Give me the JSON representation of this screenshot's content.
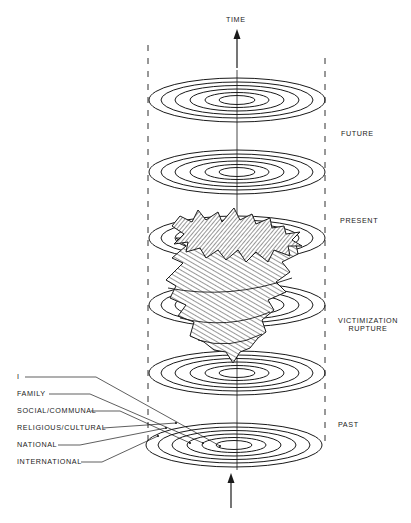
{
  "axis": {
    "label": "TIME",
    "direction": "up"
  },
  "time_labels": {
    "future": "FUTURE",
    "present": "PRESENT",
    "rupture_line1": "VICTIMIZATION",
    "rupture_line2": "RUPTURE",
    "past": "PAST"
  },
  "levels": [
    {
      "label": "I"
    },
    {
      "label": "FAMILY"
    },
    {
      "label": "SOCIAL/COMMUNAL"
    },
    {
      "label": "RELIGIOUS/CULTURAL"
    },
    {
      "label": "NATIONAL"
    },
    {
      "label": "INTERNATIONAL"
    }
  ],
  "discs": [
    {
      "name": "future",
      "cy": 100
    },
    {
      "name": "upper",
      "cy": 172
    },
    {
      "name": "present",
      "cy": 238
    },
    {
      "name": "rupture",
      "cy": 305
    },
    {
      "name": "lower",
      "cy": 373
    },
    {
      "name": "past",
      "cy": 445
    }
  ],
  "colors": {
    "ink": "#1a1a1a",
    "background": "#ffffff"
  }
}
